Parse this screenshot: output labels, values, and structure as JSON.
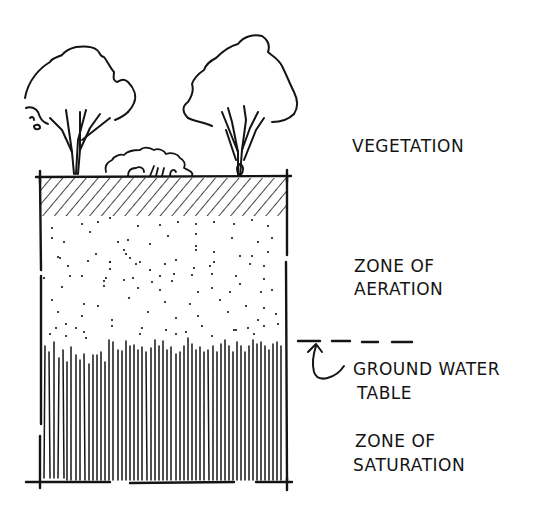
{
  "diagram": {
    "labels": {
      "vegetation": "VEGETATION",
      "zone_aeration_line1": "ZONE OF",
      "zone_aeration_line2": "AERATION",
      "water_table_line1": "GROUND WATER",
      "water_table_line2": "TABLE",
      "zone_saturation_line1": "ZONE OF",
      "zone_saturation_line2": "SATURATION"
    },
    "layers": [
      {
        "name": "topsoil",
        "pattern": "diagonal-hatch"
      },
      {
        "name": "zone-of-aeration",
        "pattern": "stipple-dots"
      },
      {
        "name": "zone-of-saturation",
        "pattern": "vertical-lines"
      }
    ],
    "vegetation_items": [
      "tree-left",
      "shrub",
      "tree-right"
    ],
    "colors": {
      "ink": "#141414",
      "paper": "#ffffff"
    }
  }
}
